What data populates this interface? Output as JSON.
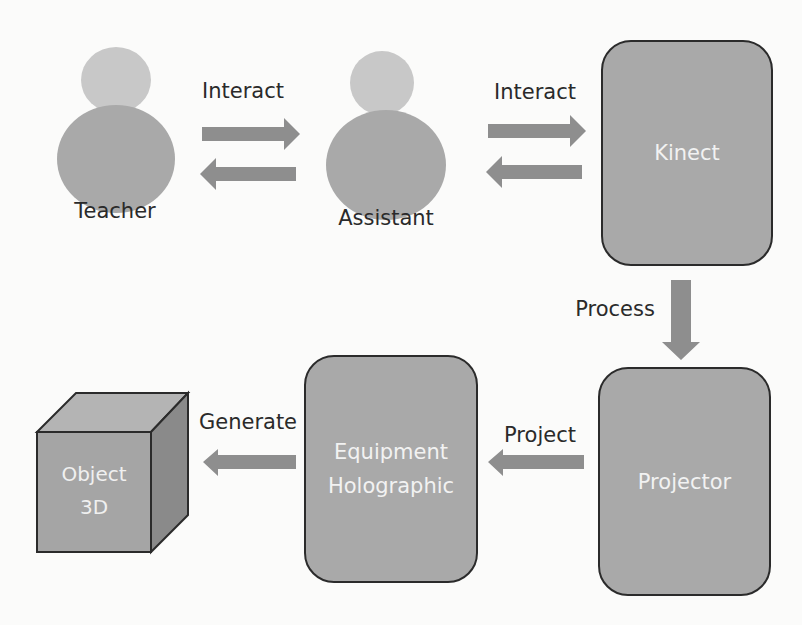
{
  "diagram": {
    "actors": [
      {
        "id": "teacher",
        "label": "Teacher"
      },
      {
        "id": "assistant",
        "label": "Assistant"
      }
    ],
    "nodes": [
      {
        "id": "kinect",
        "label": "Kinect"
      },
      {
        "id": "projector",
        "label": "Projector"
      },
      {
        "id": "equipment",
        "label_line1": "Equipment",
        "label_line2": "Holographic"
      },
      {
        "id": "object3d",
        "label_line1": "Object",
        "label_line2": "3D"
      }
    ],
    "edges": [
      {
        "from": "teacher",
        "to": "assistant",
        "label": "Interact",
        "bidirectional": true
      },
      {
        "from": "assistant",
        "to": "kinect",
        "label": "Interact",
        "bidirectional": true
      },
      {
        "from": "kinect",
        "to": "projector",
        "label": "Process"
      },
      {
        "from": "projector",
        "to": "equipment",
        "label": "Project"
      },
      {
        "from": "equipment",
        "to": "object3d",
        "label": "Generate"
      }
    ]
  },
  "colors": {
    "background": "#fbfbfa",
    "node_fill": "#a9a9a9",
    "head_fill": "#c8c8c8",
    "arrow_fill": "#8e8e8e",
    "border": "#2b2b2b",
    "text_dark": "#2a2a2a",
    "text_light": "#f2f2f2"
  }
}
